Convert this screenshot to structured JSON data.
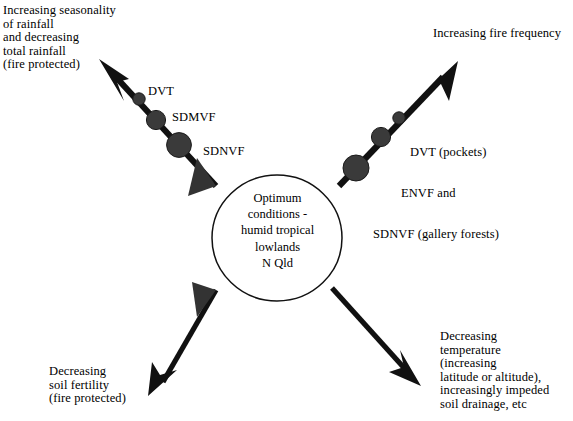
{
  "figure": {
    "type": "conceptual-gradient-diagram",
    "center": {
      "label": "Optimum conditions -\nhumid tropical\nlowlands\nN Qld",
      "shape": "ellipse"
    },
    "axes": [
      {
        "id": "upper-left",
        "direction": "up-left",
        "end_label": "Increasing seasonality\nof rainfall\nand decreasing\ntotal rainfall\n(fire protected)",
        "nodes": [
          {
            "label": "SDNVF",
            "size": "large"
          },
          {
            "label": "SDMVF",
            "size": "medium"
          },
          {
            "label": "DVT",
            "size": "small"
          }
        ]
      },
      {
        "id": "upper-right",
        "direction": "up-right",
        "end_label": "Increasing fire frequency",
        "nodes": [
          {
            "label": "SDNVF (gallery forests)",
            "size": "large"
          },
          {
            "label": "ENVF and",
            "size": "medium"
          },
          {
            "label": "DVT (pockets)",
            "size": "small"
          }
        ]
      },
      {
        "id": "lower-left",
        "direction": "down-left",
        "end_label": "Decreasing\nsoil fertility\n(fire protected)",
        "nodes": []
      },
      {
        "id": "lower-right",
        "direction": "down-right",
        "end_label": "Decreasing\ntemperature\n(increasing\nlatitude or altitude),\nincreasingly impeded\nsoil drainage, etc",
        "nodes": []
      }
    ]
  },
  "labels": {
    "top_left": "Increasing seasonality\nof rainfall\nand decreasing\ntotal rainfall\n(fire protected)",
    "top_right": "Increasing fire frequency",
    "bottom_left": "Decreasing\nsoil fertility\n(fire protected)",
    "bottom_right": "Decreasing\ntemperature\n(increasing\nlatitude or altitude),\nincreasingly impeded\nsoil drainage, etc",
    "center": "Optimum\nconditions -\nhumid tropical\nlowlands\nN Qld",
    "left_node_1": "DVT",
    "left_node_2": "SDMVF",
    "left_node_3": "SDNVF",
    "right_node_1": "DVT (pockets)",
    "right_node_2": "ENVF and",
    "right_node_3": "SDNVF (gallery forests)"
  },
  "colors": {
    "ink": "#111111",
    "background": "#ffffff",
    "node_fill": "#3a3a3a"
  }
}
